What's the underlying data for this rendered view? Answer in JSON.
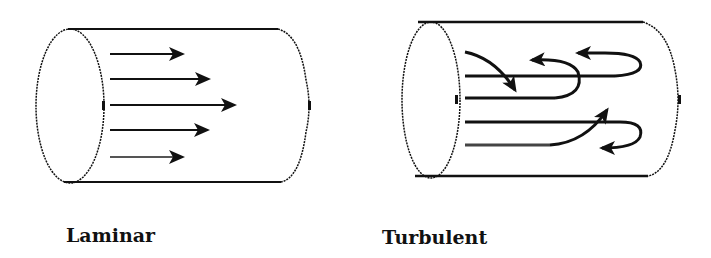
{
  "diagram": {
    "panels": [
      {
        "id": "laminar",
        "label": "Laminar",
        "description": "Pipe with parallel straight flow arrows"
      },
      {
        "id": "turbulent",
        "label": "Turbulent",
        "description": "Pipe with swirling, looping flow lines"
      }
    ],
    "colors": {
      "stroke": "#111111",
      "background": "#ffffff"
    }
  }
}
